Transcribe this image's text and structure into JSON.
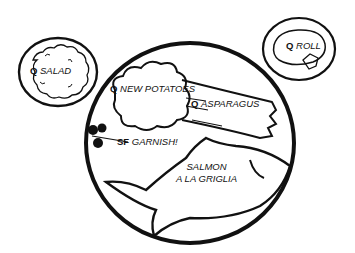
{
  "diagram": {
    "type": "plate-setting-illustration",
    "colors": {
      "ink": "#111111",
      "background": "#ffffff"
    },
    "items": [
      {
        "id": "salad",
        "prefix": "Q",
        "name": "SALAD",
        "container": "side-plate-left"
      },
      {
        "id": "roll",
        "prefix": "Q",
        "name": "ROLL",
        "container": "bread-plate-right"
      },
      {
        "id": "potatoes",
        "prefix": "Q",
        "name": "NEW POTATOES",
        "container": "main-plate"
      },
      {
        "id": "asparagus",
        "prefix": "Q",
        "name": "ASPARAGUS",
        "container": "main-plate"
      },
      {
        "id": "garnish",
        "prefix": "SF",
        "name": "GARNISH!",
        "container": "main-plate"
      },
      {
        "id": "salmon",
        "prefix": "",
        "name_line1": "SALMON",
        "name_line2": "A LA GRIGLIA",
        "container": "main-plate"
      }
    ]
  }
}
